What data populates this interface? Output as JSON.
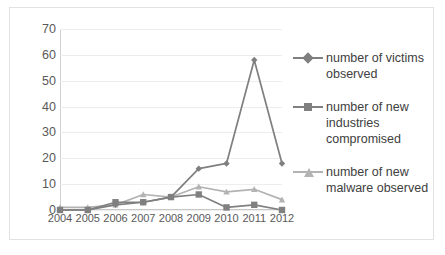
{
  "chart_data": {
    "type": "line",
    "title": "",
    "xlabel": "",
    "ylabel": "",
    "categories": [
      "2004",
      "2005",
      "2006",
      "2007",
      "2008",
      "2009",
      "2010",
      "2011",
      "2012"
    ],
    "ylim": [
      0,
      70
    ],
    "yticks": [
      0,
      10,
      20,
      30,
      40,
      50,
      60,
      70
    ],
    "grid": true,
    "legend_position": "right",
    "series": [
      {
        "name": "number of victims observed",
        "marker": "diamond",
        "color": "#7f7f7f",
        "values": [
          0,
          0,
          2,
          3,
          5,
          16,
          18,
          58,
          18
        ]
      },
      {
        "name": "number of new industries compromised",
        "marker": "square",
        "color": "#808080",
        "values": [
          0,
          0,
          3,
          3,
          5,
          6,
          1,
          2,
          0
        ]
      },
      {
        "name": "number of new malware observed",
        "marker": "triangle",
        "color": "#b3b3b3",
        "values": [
          1,
          1,
          2,
          6,
          5,
          9,
          7,
          8,
          4
        ]
      }
    ]
  },
  "legend": {
    "entries": [
      {
        "label": "number of victims observed"
      },
      {
        "label": "number of new industries compromised"
      },
      {
        "label": "number of new malware observed"
      }
    ]
  }
}
